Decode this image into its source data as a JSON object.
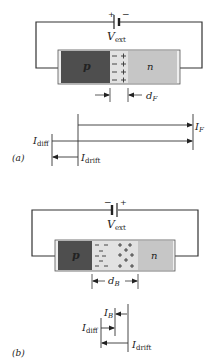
{
  "figure": {
    "panel_a": {
      "label": "(a)",
      "bias": "forward",
      "battery": {
        "left_sign": "+",
        "right_sign": "−",
        "label_main": "V",
        "label_sub": "ext"
      },
      "regions": {
        "p_label": "p",
        "n_label": "n"
      },
      "depletion_charges": {
        "left": "−",
        "right": "+",
        "rows": 4
      },
      "width_label": {
        "main": "d",
        "sub": "F"
      },
      "currents": {
        "I_F": {
          "main": "I",
          "sub": "F",
          "direction": "right"
        },
        "I_diff": {
          "main": "I",
          "sub": "diff",
          "direction": "right"
        },
        "I_drift": {
          "main": "I",
          "sub": "drift",
          "direction": "left"
        }
      }
    },
    "panel_b": {
      "label": "(b)",
      "bias": "reverse",
      "battery": {
        "left_sign": "−",
        "right_sign": "+",
        "label_main": "V",
        "label_sub": "ext"
      },
      "regions": {
        "p_label": "p",
        "n_label": "n"
      },
      "width_label": {
        "main": "d",
        "sub": "B"
      },
      "currents": {
        "I_B": {
          "main": "I",
          "sub": "B",
          "direction": "left"
        },
        "I_diff": {
          "main": "I",
          "sub": "diff",
          "direction": "right"
        },
        "I_drift": {
          "main": "I",
          "sub": "drift",
          "direction": "left"
        }
      }
    },
    "colors": {
      "p_region": "#4e4e4e",
      "depletion": "#e2e2e2",
      "n_region": "#c6c6c6",
      "end_cap": "#eeeeee",
      "line": "#333333"
    }
  }
}
